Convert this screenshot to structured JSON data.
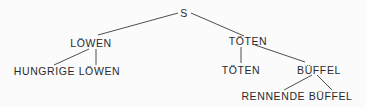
{
  "tree": {
    "root": "S",
    "nodes": [
      {
        "id": "s",
        "label": "S"
      },
      {
        "id": "loewen",
        "label": "LÖWEN"
      },
      {
        "id": "hungrige-loewen",
        "label": "HUNGRIGE LÖWEN"
      },
      {
        "id": "toeten",
        "label": "TÖTEN"
      },
      {
        "id": "toeten-leaf",
        "label": "TÖTEN"
      },
      {
        "id": "bueffel",
        "label": "BÜFFEL"
      },
      {
        "id": "rennende-bueffel",
        "label": "RENNENDE BÜFFEL"
      }
    ],
    "edges": [
      [
        "s",
        "loewen"
      ],
      [
        "s",
        "toeten"
      ],
      [
        "loewen",
        "hungrige-loewen"
      ],
      [
        "loewen",
        "hungrige-loewen"
      ],
      [
        "toeten",
        "toeten-leaf"
      ],
      [
        "toeten",
        "bueffel"
      ],
      [
        "bueffel",
        "rennende-bueffel"
      ],
      [
        "bueffel",
        "rennende-bueffel"
      ]
    ]
  }
}
